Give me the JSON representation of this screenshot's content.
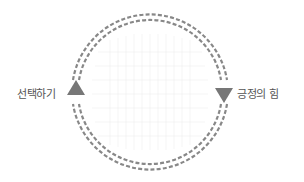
{
  "diagram": {
    "type": "cycle",
    "labels": {
      "left": "선택하기",
      "right": "긍정의 힘"
    },
    "nodes": [
      {
        "id": "left",
        "label": "선택하기",
        "arrow_direction": "up"
      },
      {
        "id": "right",
        "label": "긍정의 힘",
        "arrow_direction": "down"
      }
    ],
    "flow": "clockwise",
    "colors": {
      "ring": "#888888",
      "arrow": "#777777",
      "grid": "#eeeeee",
      "text": "#555555",
      "background": "#ffffff"
    }
  }
}
